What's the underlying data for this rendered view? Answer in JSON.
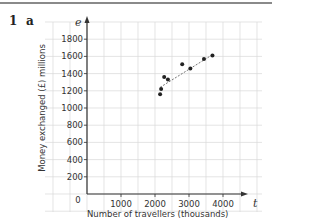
{
  "question": {
    "number": "1",
    "part": "a"
  },
  "chart_data": {
    "type": "scatter",
    "title": "",
    "xlabel": "Number of travellers (thousands)",
    "ylabel": "Money exchanged (£) millions",
    "x_axis_symbol": "t",
    "y_axis_symbol": "e",
    "x_ticks": [
      1000,
      2000,
      3000,
      4000
    ],
    "y_ticks": [
      200,
      400,
      600,
      800,
      1000,
      1200,
      1400,
      1600,
      1800
    ],
    "origin_label": "0",
    "xlim": [
      -1200,
      5200
    ],
    "ylim": [
      -200,
      2000
    ],
    "grid": true,
    "points": [
      {
        "x": 2150,
        "y": 1160
      },
      {
        "x": 2180,
        "y": 1220
      },
      {
        "x": 2270,
        "y": 1360
      },
      {
        "x": 2380,
        "y": 1330
      },
      {
        "x": 2800,
        "y": 1510
      },
      {
        "x": 3040,
        "y": 1460
      },
      {
        "x": 3440,
        "y": 1570
      },
      {
        "x": 3690,
        "y": 1610
      }
    ],
    "trend_line": {
      "style": "dashed",
      "from": {
        "x": 2150,
        "y": 1240
      },
      "to": {
        "x": 3690,
        "y": 1620
      }
    },
    "colors": {
      "grid": "#d9d9d9",
      "axis": "#333333",
      "points": "#222222",
      "trend": "#666666"
    }
  }
}
